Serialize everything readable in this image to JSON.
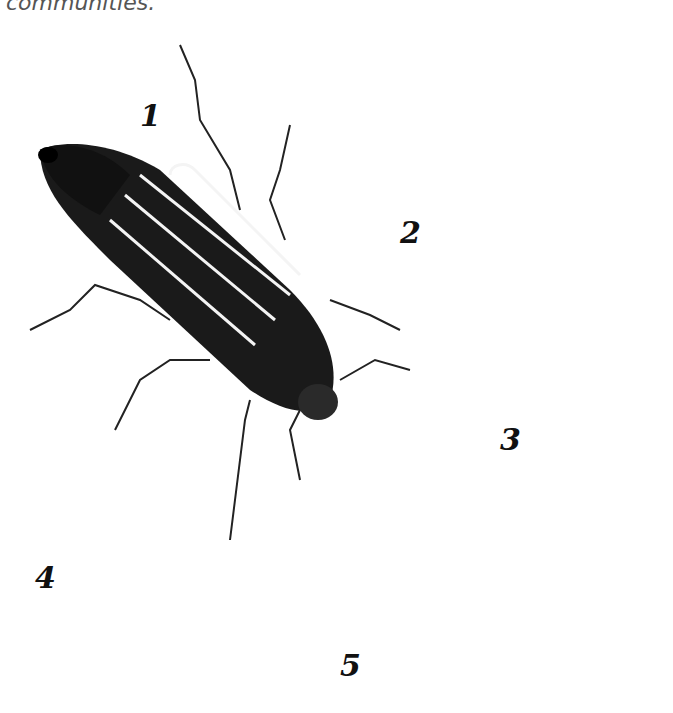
{
  "caption": {
    "text": "communities."
  },
  "figure": {
    "labels": [
      {
        "id": "1",
        "text": "1",
        "description": "adult beetle"
      },
      {
        "id": "2",
        "text": "2",
        "description": "larva, dorsal view"
      },
      {
        "id": "3",
        "text": "3",
        "description": "curled larva (grub)"
      },
      {
        "id": "4",
        "text": "4",
        "description": "pupa, ventral view"
      },
      {
        "id": "5",
        "text": "5",
        "description": "pupa, dorsal view"
      }
    ]
  }
}
